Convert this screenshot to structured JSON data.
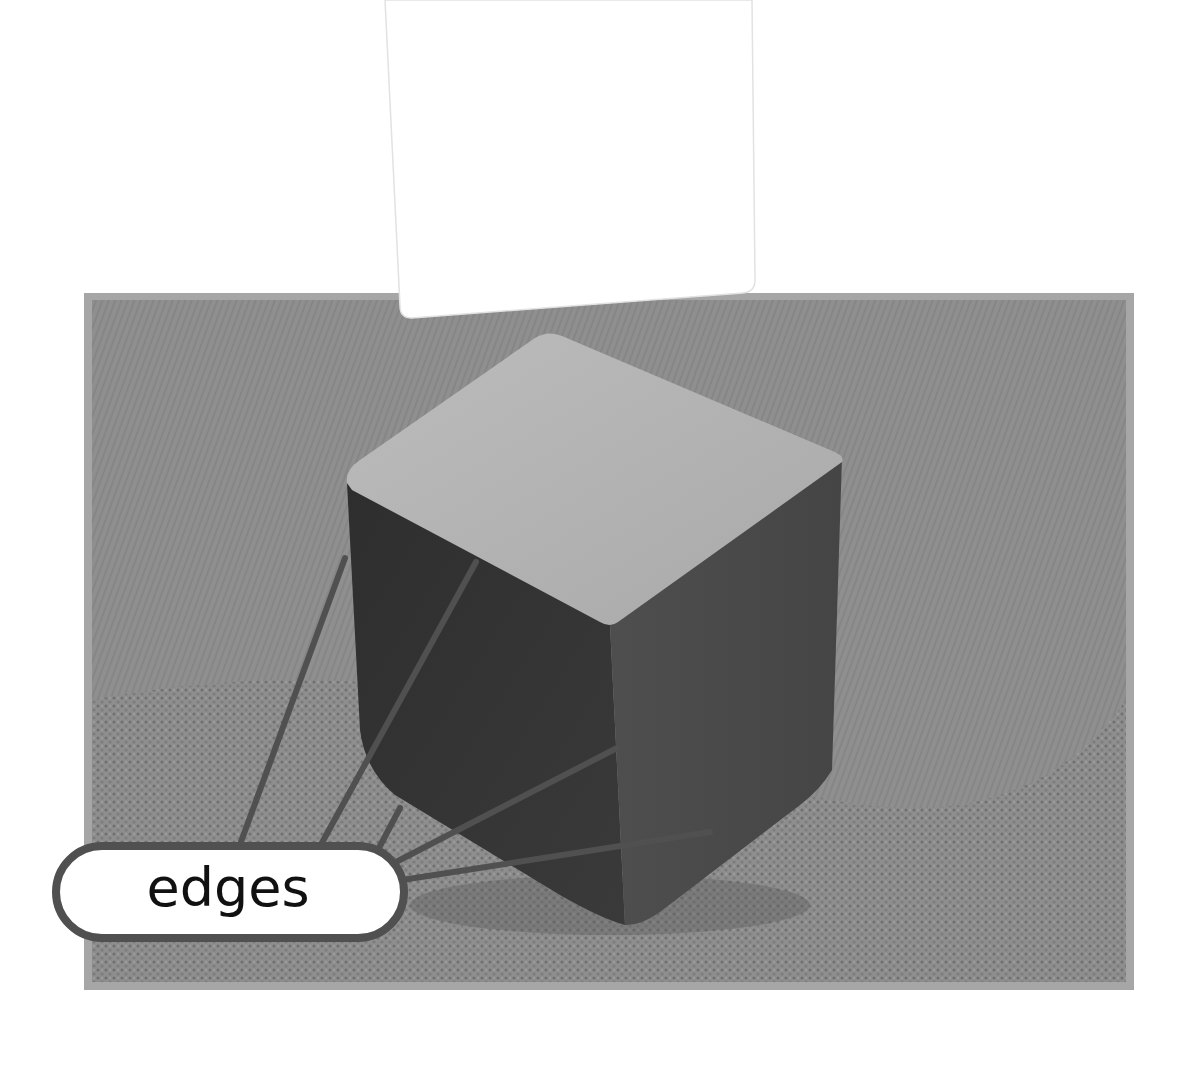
{
  "diagram": {
    "label": "edges",
    "leader_line_count": 5,
    "colors": {
      "background": "#ffffff",
      "frame_border": "#a6a6a6",
      "fabric": "#8c8c8c",
      "cube_top": "#b4b4b4",
      "cube_left": "#333333",
      "cube_right": "#4a4a4a",
      "leader_line": "#505050",
      "label_fill": "#ffffff",
      "label_stroke": "#505050",
      "label_text": "#111111",
      "card": "#ffffff"
    }
  }
}
